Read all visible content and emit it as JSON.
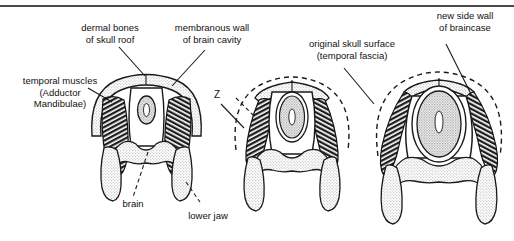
{
  "figure": {
    "title_rule": "horizontal-rule",
    "background_color": "#ffffff",
    "ink_color": "#111111",
    "stipple_color": "#c9c9c9",
    "muscle_color": "#2b2b2b"
  },
  "labels": {
    "dermal_bones": "dermal bones\nof skull roof",
    "membranous_wall": "membranous wall\nof brain cavity",
    "temporal_muscles": "temporal muscles\n(Adductor\nMandibulae)",
    "original_skull_surface": "original skull surface\n(temporal fascia)",
    "new_side_wall": "new side wall\nof braincase",
    "brain": "brain",
    "lower_jaw": "lower jaw",
    "z_marker": "Z"
  },
  "panels": [
    {
      "name": "stage-1-primitive-skull",
      "description": "primitive skull with dermal bone roof, temporal muscles inside, small brain"
    },
    {
      "name": "stage-2-intermediate-skull",
      "description": "intermediate stage, muscles bulge beyond original dashed skull surface"
    },
    {
      "name": "stage-3-expanded-braincase",
      "description": "advanced stage, enlarged braincase with new side wall, muscles external"
    }
  ]
}
